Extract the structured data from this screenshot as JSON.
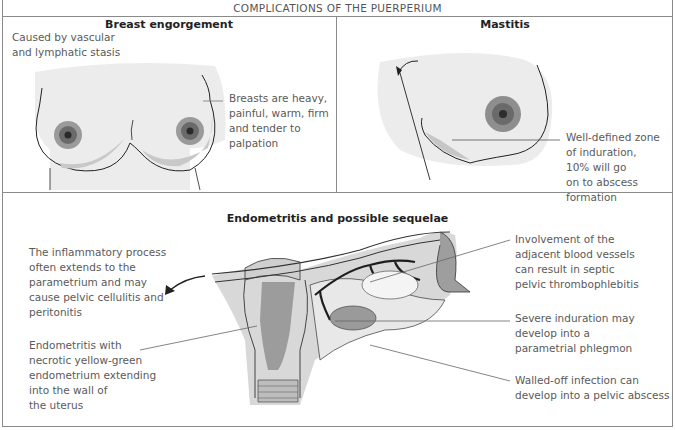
{
  "figure": {
    "title": "COMPLICATIONS OF THE PUERPERIUM"
  },
  "panels": {
    "engorgement": {
      "title": "Breast engorgement",
      "cause": [
        "Caused by vascular",
        "and lymphatic stasis"
      ],
      "finding": [
        "Breasts are heavy,",
        "painful, warm, firm",
        "and tender to",
        "palpation"
      ]
    },
    "mastitis": {
      "title": "Mastitis",
      "finding": [
        "Well-defined zone",
        "of induration,",
        "10% will go",
        "on to abscess",
        "formation"
      ]
    },
    "endometritis": {
      "title": "Endometritis and possible sequelae",
      "left_labels": {
        "extension": [
          "The inflammatory process",
          "often extends to the",
          "parametrium and may",
          "cause pelvic cellulitis and",
          "peritonitis"
        ],
        "endometritis": [
          "Endometritis with",
          "necrotic yellow-green",
          "endometrium extending",
          "into the wall of",
          "the uterus"
        ]
      },
      "right_labels": {
        "vessels": [
          "Involvement of the",
          "adjacent blood vessels",
          "can result in septic",
          "pelvic thrombophlebitis"
        ],
        "induration": [
          "Severe induration may",
          "develop into a",
          "parametrial phlegmon"
        ],
        "abscess": [
          "Walled-off infection can",
          "develop into a pelvic abscess"
        ]
      }
    }
  },
  "colors": {
    "border": "#8a8a8a",
    "shade_light": "#ececec",
    "shade_mid": "#d2d2d2",
    "shade_dark": "#a8a8a8",
    "ink": "#1e1e1e",
    "label_text": "#5a5a5a"
  }
}
